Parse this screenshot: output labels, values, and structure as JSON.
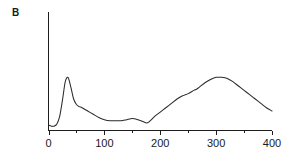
{
  "figure": {
    "panel_label": "B",
    "background_color": "#ffffff",
    "line_color": "#2a2a2a",
    "axis_color": "#1d1d1d",
    "text_color": "#1a1a1a"
  },
  "chart_data": {
    "type": "line",
    "title": "",
    "subtitle": "",
    "xlabel": "",
    "ylabel": "",
    "xlim": [
      0,
      400
    ],
    "ylim": [
      0,
      100
    ],
    "grid": false,
    "legend": null,
    "legend_position": "none",
    "x_ticks_major": [
      0,
      100,
      200,
      300,
      400
    ],
    "x_tick_labels": [
      "0",
      "100",
      "200",
      "300",
      "400"
    ],
    "x_ticks_minor": [
      50,
      150,
      250,
      350
    ],
    "y_ticks_major": [],
    "y_tick_labels": [],
    "y_axis_visible": true,
    "y_axis_labels_visible": false,
    "annotations": [],
    "series": [
      {
        "name": "signal",
        "x": [
          0,
          5,
          10,
          15,
          20,
          25,
          30,
          35,
          40,
          45,
          50,
          55,
          60,
          70,
          80,
          90,
          100,
          110,
          120,
          130,
          140,
          150,
          160,
          170,
          175,
          180,
          190,
          200,
          210,
          220,
          230,
          240,
          250,
          260,
          265,
          270,
          280,
          290,
          300,
          310,
          320,
          330,
          340,
          350,
          360,
          370,
          380,
          390,
          400
        ],
        "y": [
          5,
          4,
          4,
          6,
          13,
          28,
          45,
          49,
          40,
          29,
          24,
          22,
          21,
          18,
          15,
          12,
          10,
          9,
          9,
          9,
          10,
          11,
          10,
          8,
          7,
          8,
          13,
          17,
          21,
          25,
          29,
          32,
          34,
          37,
          38,
          40,
          44,
          47,
          49,
          49,
          48,
          45,
          41,
          37,
          33,
          29,
          25,
          21,
          18
        ]
      }
    ]
  }
}
